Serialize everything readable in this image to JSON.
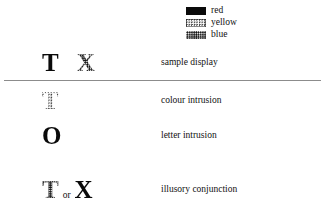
{
  "figure": {
    "legend": {
      "items": [
        {
          "label": "red",
          "pattern": "solid-black",
          "icon": "color-swatch-icon"
        },
        {
          "label": "yellow",
          "pattern": "light-stipple",
          "icon": "color-swatch-icon"
        },
        {
          "label": "blue",
          "pattern": "dense-stipple",
          "icon": "color-swatch-icon"
        }
      ]
    },
    "rows": [
      {
        "label": "sample display",
        "stimuli": [
          {
            "letter": "T",
            "pattern": "solid-black"
          },
          {
            "letter": "X",
            "pattern": "dense-stipple"
          }
        ],
        "connector": ""
      },
      {
        "label": "colour intrusion",
        "stimuli": [
          {
            "letter": "T",
            "pattern": "light-stipple"
          }
        ],
        "connector": ""
      },
      {
        "label": "letter intrusion",
        "stimuli": [
          {
            "letter": "O",
            "pattern": "solid-black"
          }
        ],
        "connector": ""
      },
      {
        "label": "illusory conjunction",
        "stimuli": [
          {
            "letter": "T",
            "pattern": "dense-stipple"
          },
          {
            "letter": "X",
            "pattern": "solid-black"
          }
        ],
        "connector": "or"
      }
    ],
    "colors": {
      "ink": "#111111",
      "rule": "#8c8c8c",
      "background": "#ffffff"
    }
  }
}
